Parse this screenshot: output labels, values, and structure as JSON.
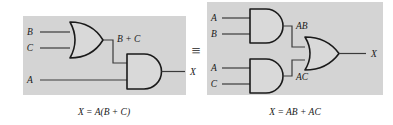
{
  "figure": {
    "equivalence_symbol": "≡",
    "colors": {
      "panel_background": "#d4d4d4",
      "gate_fill": "#d9d9d9",
      "stroke": "#1a1a1a",
      "wire": "#3a3a3a",
      "page_background": "#ffffff"
    },
    "left_circuit": {
      "name": "A(B + C) circuit",
      "inputs": [
        {
          "label": "B",
          "gate": "or-gate"
        },
        {
          "label": "C",
          "gate": "or-gate"
        },
        {
          "label": "A",
          "gate": "and-gate"
        }
      ],
      "gates": [
        {
          "type": "or-gate",
          "output_label": "B + C"
        },
        {
          "type": "and-gate",
          "output_label": "X"
        }
      ],
      "intermediate_label": "B + C",
      "output_label": "X",
      "caption": "X = A(B + C)"
    },
    "right_circuit": {
      "name": "AB + AC circuit",
      "inputs": [
        {
          "label": "A",
          "gate": "and-gate-top"
        },
        {
          "label": "B",
          "gate": "and-gate-top"
        },
        {
          "label": "A",
          "gate": "and-gate-bottom"
        },
        {
          "label": "C",
          "gate": "and-gate-bottom"
        }
      ],
      "gates": [
        {
          "type": "and-gate-top",
          "output_label": "AB"
        },
        {
          "type": "and-gate-bottom",
          "output_label": "AC"
        },
        {
          "type": "or-gate",
          "output_label": "X"
        }
      ],
      "intermediate_labels": [
        "AB",
        "AC"
      ],
      "output_label": "X",
      "caption": "X = AB + AC"
    }
  }
}
